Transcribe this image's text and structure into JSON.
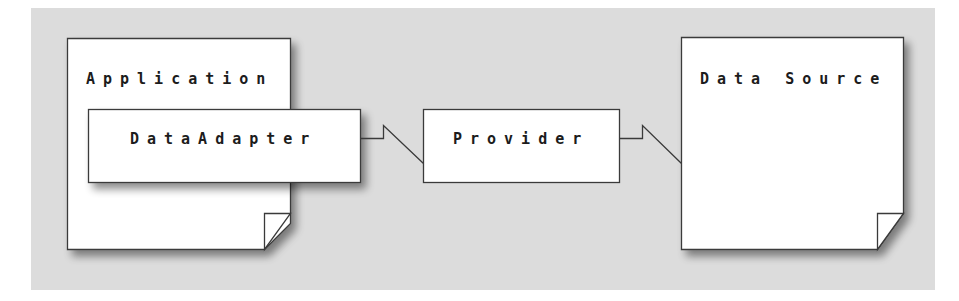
{
  "colors": {
    "background": "#dcdcdc",
    "box_fill": "#ffffff",
    "stroke": "#3a3a3a",
    "text": "#1c1c1c"
  },
  "nodes": {
    "application": {
      "label": "Application",
      "shape": "document-folded-corner"
    },
    "data_adapter": {
      "label": "DataAdapter",
      "shape": "rectangle",
      "container": "application"
    },
    "provider": {
      "label": "Provider",
      "shape": "rectangle"
    },
    "data_source": {
      "label": "Data Source",
      "shape": "document-folded-corner"
    }
  },
  "edges": [
    {
      "from": "data_adapter",
      "to": "provider",
      "style": "lightning-connector"
    },
    {
      "from": "provider",
      "to": "data_source",
      "style": "lightning-connector"
    }
  ]
}
